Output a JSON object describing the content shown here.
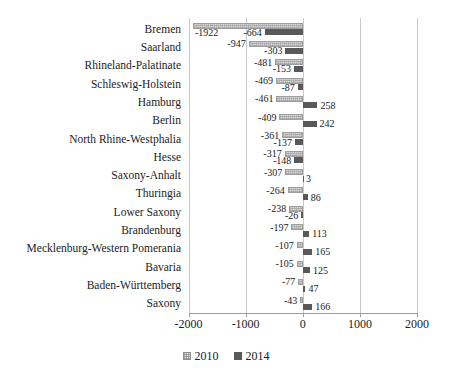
{
  "chart_data": {
    "type": "bar",
    "orientation": "horizontal",
    "title": "",
    "categories": [
      "Bremen",
      "Saarland",
      "Rhineland-Palatinate",
      "Schleswig-Holstein",
      "Hamburg",
      "Berlin",
      "North Rhine-Westphalia",
      "Hesse",
      "Saxony-Anhalt",
      "Thuringia",
      "Lower Saxony",
      "Brandenburg",
      "Mecklenburg-Western Pomerania",
      "Bavaria",
      "Baden-Württemberg",
      "Saxony"
    ],
    "series": [
      {
        "name": "2010",
        "values": [
          -1922,
          -947,
          -481,
          -469,
          -461,
          -409,
          -361,
          -317,
          -307,
          -264,
          -238,
          -197,
          -107,
          -105,
          -77,
          -43
        ]
      },
      {
        "name": "2014",
        "values": [
          -664,
          -303,
          -153,
          -87,
          258,
          242,
          -137,
          -148,
          3,
          86,
          -26,
          113,
          165,
          125,
          47,
          166
        ]
      }
    ],
    "xlim": [
      -2000,
      2000
    ],
    "x_ticks": [
      -2000,
      -1000,
      0,
      1000,
      2000
    ],
    "x_tick_labels": [
      "-2000",
      "-1000",
      "0",
      "1000",
      "2000"
    ],
    "grid": true,
    "legend_position": "bottom",
    "data_labels": "outside-end",
    "colors": {
      "series_2010_fill": "#d6d6d6",
      "series_2010_border": "#9e9e9e",
      "series_2014_fill": "#595959",
      "gridline": "#c9c9c9",
      "axis_line": "#9b9b9b",
      "text": "#222222"
    }
  }
}
